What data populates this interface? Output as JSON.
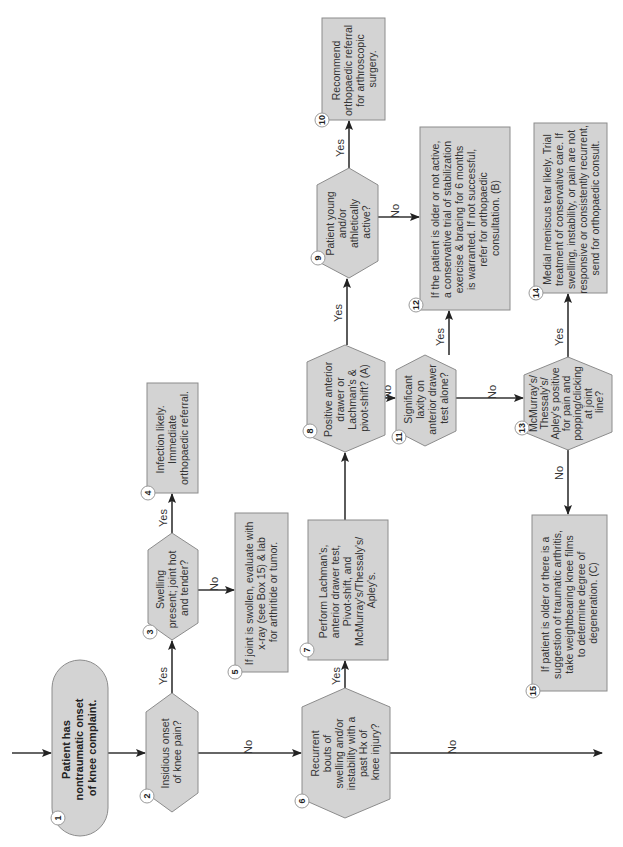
{
  "diagram": {
    "orientation": "rotated-90-ccw",
    "colors": {
      "box_fill": "#d3d3d3",
      "box_stroke": "#8c8c8c",
      "edge": "#333333",
      "text": "#333333"
    },
    "nodes": [
      {
        "id": 1,
        "shape": "terminal",
        "lines": [
          "Patient has",
          "nontraumatic onset",
          "of knee complaint."
        ]
      },
      {
        "id": 2,
        "shape": "decision",
        "lines": [
          "Insidious onset",
          "of knee pain?"
        ]
      },
      {
        "id": 3,
        "shape": "decision",
        "lines": [
          "Swelling",
          "present; joint hot",
          "and tender?"
        ]
      },
      {
        "id": 4,
        "shape": "process",
        "lines": [
          "Infection likely.",
          "Immediate",
          "orthopaedic referral."
        ]
      },
      {
        "id": 5,
        "shape": "process",
        "lines": [
          "If joint is swollen, evaluate with",
          "x-ray (see Box 15) & lab",
          "for arthritide or tumor."
        ]
      },
      {
        "id": 6,
        "shape": "decision",
        "lines": [
          "Recurrent",
          "bouts of",
          "swelling and/or",
          "instability with a",
          "past Hx of",
          "knee injury?"
        ]
      },
      {
        "id": 7,
        "shape": "process",
        "lines": [
          "Perform Lachman's,",
          "anterior drawer test,",
          "Pivot-shift, and",
          "McMurray's/Thessaly's/",
          "Apley's."
        ]
      },
      {
        "id": 8,
        "shape": "decision",
        "lines": [
          "Positive anterior",
          "drawer or",
          "Lachman's &",
          "pivot-shift? (A)"
        ]
      },
      {
        "id": 9,
        "shape": "decision",
        "lines": [
          "Patient young",
          "and/or",
          "athletically",
          "active?"
        ]
      },
      {
        "id": 10,
        "shape": "process",
        "lines": [
          "Recommend",
          "orthopaedic referral",
          "for arthroscopic",
          "surgery."
        ]
      },
      {
        "id": 11,
        "shape": "decision",
        "lines": [
          "Significant",
          "laxity on",
          "anterior drawer",
          "test alone?"
        ]
      },
      {
        "id": 12,
        "shape": "process",
        "lines": [
          "If the patient is older or not active,",
          "a conservative trial of stabilization",
          "exercise & bracing for 6 months",
          "is warranted. If not successful,",
          "refer for orthopaedic",
          "consultation. (B)"
        ]
      },
      {
        "id": 13,
        "shape": "decision",
        "lines": [
          "McMurray's/",
          "Thessaly's/",
          "Apley's positive",
          "for pain and",
          "popping/clicking",
          "at joint",
          "line?"
        ]
      },
      {
        "id": 14,
        "shape": "process",
        "lines": [
          "Medial meniscus tear likely. Trial",
          "treatment of conservative care. If",
          "swelling, instability, or pain are not",
          "responsive or consistently recurrent,",
          "send for orthopaedic consult."
        ]
      },
      {
        "id": 15,
        "shape": "process",
        "lines": [
          "If patient is older or there is a",
          "suggestion of traumatic arthritis,",
          "take weightbearing knee films",
          "to determine degree of",
          "degeneration. (C)"
        ]
      }
    ],
    "edges": [
      {
        "from": "start",
        "to": 1,
        "label": ""
      },
      {
        "from": 1,
        "to": 2,
        "label": ""
      },
      {
        "from": 2,
        "to": 3,
        "label": "Yes"
      },
      {
        "from": 2,
        "to": 6,
        "label": "No"
      },
      {
        "from": 3,
        "to": 4,
        "label": "Yes"
      },
      {
        "from": 3,
        "to": 5,
        "label": "No"
      },
      {
        "from": 6,
        "to": 7,
        "label": "Yes"
      },
      {
        "from": 6,
        "to": "off-page",
        "label": "No"
      },
      {
        "from": 7,
        "to": 8,
        "label": ""
      },
      {
        "from": 8,
        "to": 9,
        "label": "Yes"
      },
      {
        "from": 8,
        "to": 11,
        "label": "No"
      },
      {
        "from": 9,
        "to": 10,
        "label": "Yes"
      },
      {
        "from": 9,
        "to": 12,
        "label": "No"
      },
      {
        "from": 11,
        "to": 12,
        "label": "Yes"
      },
      {
        "from": 11,
        "to": 13,
        "label": "No"
      },
      {
        "from": 13,
        "to": 14,
        "label": "Yes"
      },
      {
        "from": 13,
        "to": 15,
        "label": "No"
      }
    ],
    "labels": {
      "yes": "Yes",
      "no": "No"
    }
  }
}
